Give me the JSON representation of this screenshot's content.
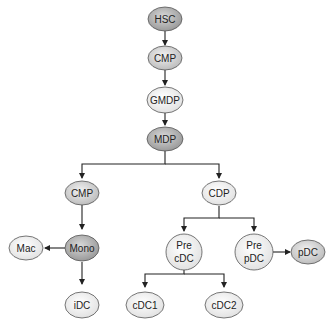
{
  "diagram": {
    "type": "hematopoietic-lineage-tree",
    "colors": {
      "dark_node": "#a9a9a9",
      "medium_node": "#cfcfcf",
      "light_node": "#ececec",
      "stroke": "#555555",
      "edge": "#222222"
    },
    "nodes": [
      {
        "id": "hsc",
        "label": "HSC"
      },
      {
        "id": "cmp_top",
        "label": "CMP"
      },
      {
        "id": "gmdp",
        "label": "GMDP"
      },
      {
        "id": "mdp",
        "label": "MDP"
      },
      {
        "id": "cmp_left",
        "label": "CMP"
      },
      {
        "id": "cdp",
        "label": "CDP"
      },
      {
        "id": "mono",
        "label": "Mono"
      },
      {
        "id": "mac",
        "label": "Mac"
      },
      {
        "id": "idc",
        "label": "iDC"
      },
      {
        "id": "pre_cdc",
        "label_line1": "Pre",
        "label_line2": "cDC"
      },
      {
        "id": "pre_pdc",
        "label_line1": "Pre",
        "label_line2": "pDC"
      },
      {
        "id": "pdc",
        "label": "pDC"
      },
      {
        "id": "cdc1",
        "label": "cDC1"
      },
      {
        "id": "cdc2",
        "label": "cDC2"
      }
    ],
    "edges": [
      [
        "HSC",
        "CMP"
      ],
      [
        "CMP",
        "GMDP"
      ],
      [
        "GMDP",
        "MDP"
      ],
      [
        "MDP",
        "CMP"
      ],
      [
        "MDP",
        "CDP"
      ],
      [
        "CMP",
        "Mono"
      ],
      [
        "Mono",
        "Mac"
      ],
      [
        "Mono",
        "iDC"
      ],
      [
        "CDP",
        "Pre cDC"
      ],
      [
        "CDP",
        "Pre pDC"
      ],
      [
        "Pre pDC",
        "pDC"
      ],
      [
        "Pre cDC",
        "cDC1"
      ],
      [
        "Pre cDC",
        "cDC2"
      ]
    ]
  }
}
